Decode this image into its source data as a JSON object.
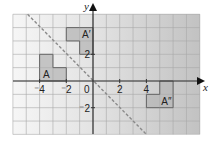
{
  "diagram": {
    "type": "coordinate-grid-reflection",
    "axes": {
      "x_label": "x",
      "y_label": "y",
      "origin_label": "0",
      "x_ticks": [
        {
          "value": -4,
          "label": "⁻4"
        },
        {
          "value": -2,
          "label": "⁻2"
        },
        {
          "value": 2,
          "label": "2"
        },
        {
          "value": 4,
          "label": "4"
        }
      ],
      "y_ticks": [
        {
          "value": 2,
          "label": "2"
        },
        {
          "value": -2,
          "label": "⁻2"
        }
      ],
      "x_range": [
        -6,
        8
      ],
      "y_range": [
        -4,
        5
      ]
    },
    "mirror_line": {
      "equation": "y = -x",
      "style": "dashed",
      "from": [
        -4.9,
        5
      ],
      "to": [
        4,
        -4
      ]
    },
    "shapes": [
      {
        "name": "A",
        "label": "A",
        "cells": [
          [
            -4,
            1
          ],
          [
            -4,
            0
          ],
          [
            -3,
            0
          ]
        ],
        "label_cell": [
          -4,
          0
        ]
      },
      {
        "name": "A-prime",
        "label": "A′",
        "cells": [
          [
            -2,
            3
          ],
          [
            -1,
            3
          ],
          [
            -1,
            2
          ]
        ],
        "label_cell": [
          -1,
          3
        ]
      },
      {
        "name": "A-double-prime",
        "label": "A″",
        "cells": [
          [
            5,
            -1
          ],
          [
            4,
            -2
          ],
          [
            5,
            -2
          ]
        ],
        "label_cell": [
          5,
          -2
        ]
      }
    ],
    "colors": {
      "background_left": "#f4f4f4",
      "background_right": "#c4c4c4",
      "grid_line": "#a8a8a8",
      "axis": "#333333",
      "shape_fill": "#b5b5b5",
      "shape_outline": "#666666",
      "mirror_line": "#888888"
    }
  }
}
